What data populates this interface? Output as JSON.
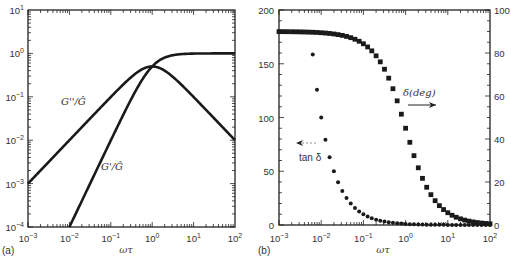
{
  "figure": {
    "panel_a_tag": "(a)",
    "panel_b_tag": "(b)"
  },
  "chart_data": [
    {
      "id": "a",
      "type": "line",
      "title": "",
      "xlabel": "ωτ",
      "ylabel": "",
      "xscale": "log",
      "yscale": "log",
      "xlim": [
        0.001,
        100
      ],
      "ylim": [
        0.0001,
        10
      ],
      "grid": false,
      "x_tick_labels": [
        "10^-3",
        "10^-2",
        "10^-1",
        "10^0",
        "10^1",
        "10^2"
      ],
      "y_tick_labels": [
        "10^-4",
        "10^-3",
        "10^-2",
        "10^-1",
        "10^0",
        "10^1"
      ],
      "annotations": [
        {
          "text": "G''/Ĝ",
          "x": 0.012,
          "y": 0.055
        },
        {
          "text": "G'/Ĝ",
          "x": 0.055,
          "y": 0.0023
        }
      ],
      "series": [
        {
          "name": "G''/Ĝ",
          "x": [
            0.001,
            0.00316,
            0.01,
            0.0316,
            0.1,
            0.316,
            1,
            3.16,
            10,
            31.6,
            100
          ],
          "values": [
            0.001,
            0.00316,
            0.01,
            0.0316,
            0.099,
            0.288,
            0.5,
            0.288,
            0.099,
            0.0316,
            0.01
          ]
        },
        {
          "name": "G'/Ĝ",
          "x": [
            0.01,
            0.0316,
            0.1,
            0.316,
            1,
            3.16,
            10,
            31.6,
            100
          ],
          "values": [
            0.0001,
            0.001,
            0.0099,
            0.091,
            0.5,
            0.909,
            0.99,
            0.999,
            1.0
          ]
        }
      ]
    },
    {
      "id": "b",
      "type": "scatter",
      "title": "",
      "xlabel": "ωτ",
      "ylabel_left": "tan δ",
      "ylabel_right": "δ (deg)",
      "xscale": "log",
      "xlim": [
        0.001,
        100
      ],
      "ylim_left": [
        0,
        200
      ],
      "ylim_right": [
        0,
        100
      ],
      "grid": false,
      "x_tick_labels": [
        "10^-3",
        "10^-2",
        "10^-1",
        "10^0",
        "10^1",
        "10^2"
      ],
      "y_left_tick_labels": [
        "0",
        "50",
        "100",
        "150",
        "200"
      ],
      "y_right_tick_labels": [
        "0",
        "20",
        "40",
        "60",
        "80",
        "100"
      ],
      "annotations": [
        {
          "text": "δ(deg)",
          "arrow": "right"
        },
        {
          "text": "tan δ",
          "arrow": "left"
        }
      ],
      "series": [
        {
          "name": "tan δ",
          "axis": "left",
          "marker": "circle",
          "x": [
            0.00631,
            0.00794,
            0.01,
            0.0126,
            0.0158,
            0.02,
            0.0251,
            0.0316,
            0.0398,
            0.0501,
            0.0631,
            0.0794,
            0.1,
            0.126,
            0.158,
            0.2,
            0.251,
            0.316,
            0.398,
            0.501,
            0.631,
            0.794,
            1,
            1.26,
            1.58,
            2,
            2.51,
            3.16,
            3.98,
            5.01,
            6.31,
            7.94,
            10,
            12.6,
            15.8,
            20,
            25.1,
            31.6,
            39.8,
            50.1,
            63.1,
            79.4,
            100
          ],
          "values": [
            158.5,
            125.9,
            100,
            79.4,
            63.1,
            50.1,
            39.8,
            31.6,
            25.1,
            20.0,
            15.8,
            12.6,
            10.0,
            7.9,
            6.3,
            5.0,
            4.0,
            3.2,
            2.5,
            2.0,
            1.6,
            1.3,
            1.0,
            0.79,
            0.63,
            0.5,
            0.4,
            0.32,
            0.25,
            0.2,
            0.16,
            0.13,
            0.1,
            0.08,
            0.06,
            0.05,
            0.04,
            0.03,
            0.025,
            0.02,
            0.016,
            0.013,
            0.01
          ]
        },
        {
          "name": "δ (deg)",
          "axis": "right",
          "marker": "square",
          "x": [
            0.001,
            0.00126,
            0.00158,
            0.002,
            0.00251,
            0.00316,
            0.00398,
            0.00501,
            0.00631,
            0.00794,
            0.01,
            0.0126,
            0.0158,
            0.02,
            0.0251,
            0.0316,
            0.0398,
            0.0501,
            0.0631,
            0.0794,
            0.1,
            0.126,
            0.158,
            0.2,
            0.251,
            0.316,
            0.398,
            0.501,
            0.631,
            0.794,
            1,
            1.26,
            1.58,
            2,
            2.51,
            3.16,
            3.98,
            5.01,
            6.31,
            7.94,
            10,
            12.6,
            15.8,
            20,
            25.1,
            31.6,
            39.8,
            50.1,
            63.1,
            79.4,
            100
          ],
          "values": [
            89.94,
            89.93,
            89.91,
            89.89,
            89.86,
            89.82,
            89.77,
            89.71,
            89.64,
            89.55,
            89.43,
            89.28,
            89.09,
            88.85,
            88.56,
            88.19,
            87.72,
            87.13,
            86.39,
            85.46,
            84.29,
            82.82,
            81.0,
            78.69,
            75.89,
            72.45,
            68.3,
            63.39,
            57.75,
            51.54,
            45.0,
            38.46,
            32.25,
            26.61,
            21.7,
            17.55,
            14.11,
            11.31,
            9.0,
            7.18,
            5.71,
            4.54,
            3.61,
            2.86,
            2.28,
            1.81,
            1.44,
            1.14,
            0.91,
            0.72,
            0.57
          ]
        }
      ]
    }
  ]
}
